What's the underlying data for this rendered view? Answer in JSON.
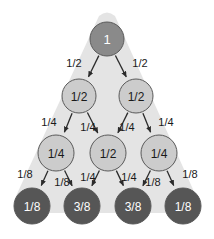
{
  "diagram": {
    "type": "binary-probability-tree",
    "levels": 4,
    "background_shape": "rounded-triangle",
    "colors": {
      "page_background": "#ffffff",
      "triangle_fill": "#e4e4e4",
      "node_level0_fill": "#8a8a8a",
      "node_level1_fill": "#cccccc",
      "node_level2_fill": "#cccccc",
      "node_level3_fill": "#565656",
      "node_stroke": "#5a5a5a",
      "edge_stroke": "#2b2b2b",
      "label_dark": "#1a1a1a",
      "label_light": "#ffffff"
    },
    "nodes": [
      {
        "id": "n0-0",
        "label": "1",
        "level": 0,
        "cx": 107,
        "cy": 39,
        "r": 17,
        "fill_key": "node_level0_fill",
        "text_key": "label_light"
      },
      {
        "id": "n1-0",
        "label": "1/2",
        "level": 1,
        "cx": 79,
        "cy": 96,
        "r": 17,
        "fill_key": "node_level1_fill",
        "text_key": "label_dark"
      },
      {
        "id": "n1-1",
        "label": "1/2",
        "level": 1,
        "cx": 136,
        "cy": 96,
        "r": 17,
        "fill_key": "node_level1_fill",
        "text_key": "label_dark"
      },
      {
        "id": "n2-0",
        "label": "1/4",
        "level": 2,
        "cx": 56,
        "cy": 153,
        "r": 18,
        "fill_key": "node_level2_fill",
        "text_key": "label_dark"
      },
      {
        "id": "n2-1",
        "label": "1/2",
        "level": 2,
        "cx": 108,
        "cy": 153,
        "r": 18,
        "fill_key": "node_level2_fill",
        "text_key": "label_dark"
      },
      {
        "id": "n2-2",
        "label": "1/4",
        "level": 2,
        "cx": 159,
        "cy": 153,
        "r": 18,
        "fill_key": "node_level2_fill",
        "text_key": "label_dark"
      },
      {
        "id": "n3-0",
        "label": "1/8",
        "level": 3,
        "cx": 32,
        "cy": 206,
        "r": 18,
        "fill_key": "node_level3_fill",
        "text_key": "label_light"
      },
      {
        "id": "n3-1",
        "label": "3/8",
        "level": 3,
        "cx": 82,
        "cy": 206,
        "r": 18,
        "fill_key": "node_level3_fill",
        "text_key": "label_light"
      },
      {
        "id": "n3-2",
        "label": "3/8",
        "level": 3,
        "cx": 133,
        "cy": 206,
        "r": 18,
        "fill_key": "node_level3_fill",
        "text_key": "label_light"
      },
      {
        "id": "n3-3",
        "label": "1/8",
        "level": 3,
        "cx": 183,
        "cy": 206,
        "r": 18,
        "fill_key": "node_level3_fill",
        "text_key": "label_light"
      }
    ],
    "edges": [
      {
        "id": "e0",
        "from": "n0-0",
        "to": "n1-0",
        "label": "1/2",
        "lx": 74,
        "ly": 63
      },
      {
        "id": "e1",
        "from": "n0-0",
        "to": "n1-1",
        "label": "1/2",
        "lx": 140,
        "ly": 63
      },
      {
        "id": "e2",
        "from": "n1-0",
        "to": "n2-0",
        "label": "1/4",
        "lx": 49,
        "ly": 122
      },
      {
        "id": "e3",
        "from": "n1-0",
        "to": "n2-1",
        "label": "1/4",
        "lx": 88,
        "ly": 127
      },
      {
        "id": "e4",
        "from": "n1-1",
        "to": "n2-1",
        "label": "1/4",
        "lx": 127,
        "ly": 127
      },
      {
        "id": "e5",
        "from": "n1-1",
        "to": "n2-2",
        "label": "1/4",
        "lx": 166,
        "ly": 122
      },
      {
        "id": "e6",
        "from": "n2-0",
        "to": "n3-0",
        "label": "1/8",
        "lx": 25,
        "ly": 174
      },
      {
        "id": "e7",
        "from": "n2-0",
        "to": "n3-1",
        "label": "1/8",
        "lx": 62,
        "ly": 182
      },
      {
        "id": "e8",
        "from": "n2-1",
        "to": "n3-1",
        "label": "1/4",
        "lx": 88,
        "ly": 177
      },
      {
        "id": "e9",
        "from": "n2-1",
        "to": "n3-2",
        "label": "1/4",
        "lx": 129,
        "ly": 177
      },
      {
        "id": "e10",
        "from": "n2-2",
        "to": "n3-2",
        "label": "1/8",
        "lx": 153,
        "ly": 182
      },
      {
        "id": "e11",
        "from": "n2-2",
        "to": "n3-3",
        "label": "1/8",
        "lx": 190,
        "ly": 174
      }
    ]
  }
}
